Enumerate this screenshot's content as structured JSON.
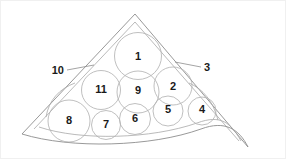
{
  "figure": {
    "background_color": "#ffffff",
    "outline_color": "#8d8d8d",
    "circle_stroke_color": "#b4b4b4",
    "label_color": "#1a1a1a",
    "border_color": "#f0f0f0"
  },
  "structures": [
    {
      "id": "s1",
      "label": "1",
      "cx": 137,
      "cy": 55,
      "r": 23.5,
      "label_x": 137,
      "label_y": 55
    },
    {
      "id": "s11",
      "label": "11",
      "cx": 100,
      "cy": 89,
      "r": 19.5,
      "label_x": 100,
      "label_y": 88
    },
    {
      "id": "s9",
      "label": "9",
      "cx": 137,
      "cy": 91,
      "r": 21.0,
      "label_x": 137,
      "label_y": 89
    },
    {
      "id": "s2",
      "label": "2",
      "cx": 172,
      "cy": 85,
      "r": 19.0,
      "label_x": 172,
      "label_y": 85
    },
    {
      "id": "s8",
      "label": "8",
      "cx": 68,
      "cy": 120,
      "r": 21.0,
      "label_x": 68,
      "label_y": 119
    },
    {
      "id": "s7",
      "label": "7",
      "cx": 105,
      "cy": 124,
      "r": 14.5,
      "label_x": 105,
      "label_y": 123
    },
    {
      "id": "s6",
      "label": "6",
      "cx": 134,
      "cy": 118,
      "r": 15.5,
      "label_x": 134,
      "label_y": 117
    },
    {
      "id": "s5",
      "label": "5",
      "cx": 167,
      "cy": 110,
      "r": 15.0,
      "label_x": 167,
      "label_y": 108
    },
    {
      "id": "s4",
      "label": "4",
      "cx": 201,
      "cy": 110,
      "r": 14.0,
      "label_x": 201,
      "label_y": 108
    }
  ],
  "callouts": [
    {
      "id": "c10",
      "label": "10",
      "side": "left",
      "label_x": 63,
      "label_y": 69,
      "line": {
        "x1": 66,
        "y1": 69,
        "x2": 93,
        "y2": 64
      }
    },
    {
      "id": "c3",
      "label": "3",
      "side": "right",
      "label_x": 203,
      "label_y": 66,
      "line": {
        "x1": 200,
        "y1": 66,
        "x2": 174,
        "y2": 61
      }
    }
  ],
  "outlines": {
    "outer_boundary": "M 21 133 L 134 13 L 247 146",
    "inner_boundary": "M 33 128 L 134 21 L 238 140",
    "bottom_curve_outer": "M 21 133 C 70 148, 150 146, 200 128 C 224 119, 238 128, 247 146",
    "bottom_curve_inner": "M 38 126 C 80 140, 150 138, 196 122 C 220 113, 230 122, 240 140",
    "left_arc": "M 45 116 C 48 99, 58 88, 74 82",
    "right_arc": "M 217 119 C 212 100, 202 88, 188 82"
  }
}
